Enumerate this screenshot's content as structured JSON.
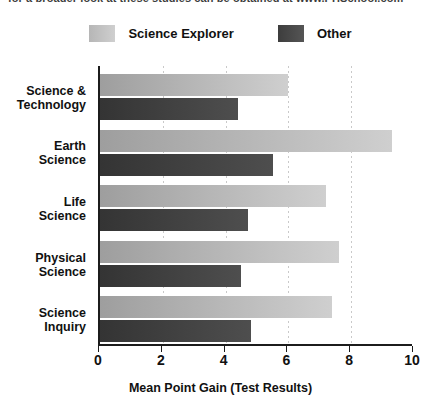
{
  "top_clipped_text": "for a broader look at these studies can be obtained at www.PHSchool.com",
  "legend": {
    "position": "top-center",
    "entries": [
      {
        "label": "Science Explorer",
        "swatch_name": "legend-swatch-science-explorer",
        "color": "#c2c2c2"
      },
      {
        "label": "Other",
        "swatch_name": "legend-swatch-other",
        "color": "#4a4a4a"
      }
    ]
  },
  "chart_data": {
    "type": "bar",
    "orientation": "horizontal",
    "title": "",
    "xlabel": "Mean Point Gain (Test Results)",
    "ylabel": "",
    "xlim": [
      0,
      10
    ],
    "xticks": [
      0,
      2,
      4,
      6,
      8,
      10
    ],
    "xticklabels": [
      "0",
      "2",
      "4",
      "6",
      "8",
      "10"
    ],
    "grid": "vertical-dotted",
    "legend_position": "top-center",
    "categories": [
      "Science &\nTechnology",
      "Earth\nScience",
      "Life\nScience",
      "Physical\nScience",
      "Science\nInquiry"
    ],
    "category_lines": [
      [
        "Science &",
        "Technology"
      ],
      [
        "Earth",
        "Science"
      ],
      [
        "Life",
        "Science"
      ],
      [
        "Physical",
        "Science"
      ],
      [
        "Science",
        "Inquiry"
      ]
    ],
    "series": [
      {
        "name": "Science Explorer",
        "color": "#c2c2c2",
        "values": [
          6.0,
          9.3,
          7.2,
          7.6,
          7.4
        ]
      },
      {
        "name": "Other",
        "color": "#454545",
        "values": [
          4.4,
          5.5,
          4.7,
          4.5,
          4.8
        ]
      }
    ]
  }
}
